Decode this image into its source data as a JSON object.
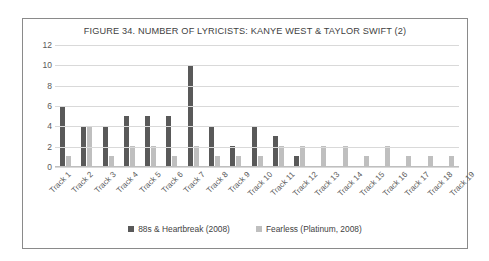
{
  "chart_data": {
    "type": "bar",
    "title": "FIGURE 34. NUMBER OF LYRICISTS: KANYE WEST & TAYLOR SWIFT (2)",
    "xlabel": "",
    "ylabel": "",
    "ylim": [
      0,
      12
    ],
    "yticks": [
      12,
      10,
      8,
      6,
      4,
      2,
      0
    ],
    "grid": true,
    "legend_position": "bottom",
    "categories": [
      "Track 1",
      "Track 2",
      "Track 3",
      "Track 4",
      "Track 5",
      "Track 6",
      "Track 7",
      "Track 8",
      "Track 9",
      "Track 10",
      "Track 11",
      "Track 12",
      "Track 13",
      "Track 14",
      "Track 15",
      "Track 16",
      "Track 17",
      "Track 18",
      "Track 19"
    ],
    "series": [
      {
        "name": "88s & Heartbreak (2008)",
        "color": "#595959",
        "values": [
          6,
          4,
          4,
          5,
          5,
          5,
          10,
          4,
          2,
          4,
          3,
          1,
          0,
          0,
          0,
          0,
          0,
          0,
          0
        ]
      },
      {
        "name": "Fearless (Platinum, 2008)",
        "color": "#bfbfbf",
        "values": [
          1,
          4,
          1,
          2,
          2,
          1,
          2,
          1,
          1,
          1,
          2,
          2,
          2,
          2,
          1,
          2,
          1,
          1,
          1
        ]
      }
    ]
  },
  "colors": {
    "series_dark": "#595959",
    "series_light": "#bfbfbf",
    "gridline": "#d9d9d9",
    "border": "#8a8a8a",
    "text": "#3f3f3f",
    "background": "#ffffff"
  }
}
